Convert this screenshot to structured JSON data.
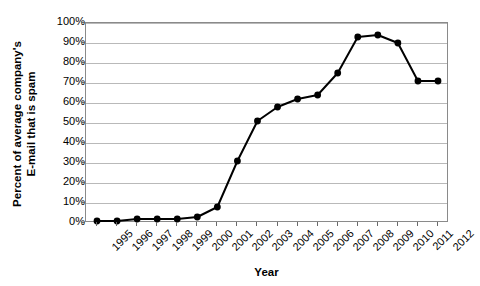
{
  "chart_data": {
    "type": "line",
    "title": "",
    "xlabel": "Year",
    "ylabel": "Percent of average company's E-mail that is spam",
    "ylabel_lines": [
      "Percent of average company's",
      "E-mail that is spam"
    ],
    "categories": [
      "1995",
      "1996",
      "1997",
      "1998",
      "1999",
      "2000",
      "2001",
      "2002",
      "2003",
      "2004",
      "2005",
      "2006",
      "2007",
      "2008",
      "2009",
      "2010",
      "2011",
      "2012"
    ],
    "values": [
      1,
      1,
      2,
      2,
      2,
      3,
      8,
      31,
      51,
      58,
      62,
      64,
      75,
      93,
      94,
      90,
      71,
      71
    ],
    "series": [
      {
        "name": "Percent of e-mail that is spam",
        "values": [
          1,
          1,
          2,
          2,
          2,
          3,
          8,
          31,
          51,
          58,
          62,
          64,
          75,
          93,
          94,
          90,
          71,
          71
        ]
      }
    ],
    "ylim": [
      0,
      100
    ],
    "ytick_values": [
      0,
      10,
      20,
      30,
      40,
      50,
      60,
      70,
      80,
      90,
      100
    ],
    "ytick_labels": [
      "0%",
      "10%",
      "20%",
      "30%",
      "40%",
      "50%",
      "60%",
      "70%",
      "80%",
      "90%",
      "100%"
    ],
    "grid": true,
    "legend": false,
    "legend_position": "none",
    "marker": "filled-circle",
    "line_color": "#000000",
    "marker_color": "#000000",
    "grid_color": "#b9b9b9",
    "axis_color": "#8a8a8a",
    "background_color": "#ffffff"
  }
}
